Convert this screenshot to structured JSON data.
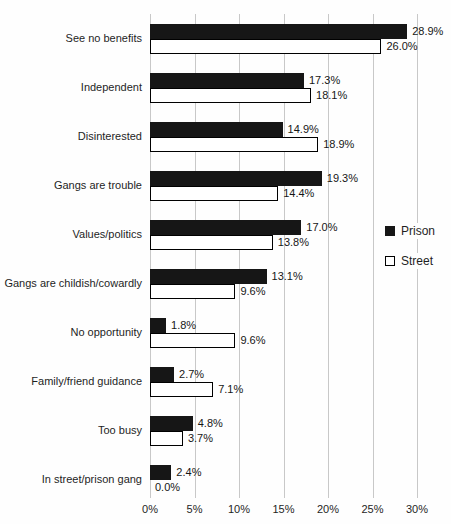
{
  "chart_data": {
    "type": "bar",
    "orientation": "horizontal",
    "title": "",
    "xlabel": "",
    "ylabel": "",
    "xlim": [
      0,
      30
    ],
    "grid": "vertical gridlines every 5%",
    "x_ticks": [
      "0%",
      "5%",
      "10%",
      "15%",
      "20%",
      "25%",
      "30%"
    ],
    "categories": [
      "See no benefits",
      "Independent",
      "Disinterested",
      "Gangs are trouble",
      "Values/politics",
      "Gangs are childish/cowardly",
      "No opportunity",
      "Family/friend guidance",
      "Too busy",
      "In street/prison gang"
    ],
    "series": [
      {
        "name": "Prison",
        "style": "filled",
        "color": "#161616",
        "values": [
          28.9,
          17.3,
          14.9,
          19.3,
          17.0,
          13.1,
          1.8,
          2.7,
          4.8,
          2.4
        ],
        "labels": [
          "28.9%",
          "17.3%",
          "14.9%",
          "19.3%",
          "17.0%",
          "13.1%",
          "1.8%",
          "2.7%",
          "4.8%",
          "2.4%"
        ]
      },
      {
        "name": "Street",
        "style": "outlined",
        "color": "#ffffff",
        "values": [
          26.0,
          18.1,
          18.9,
          14.4,
          13.8,
          9.6,
          9.6,
          7.1,
          3.7,
          0.0
        ],
        "labels": [
          "26.0%",
          "18.1%",
          "18.9%",
          "14.4%",
          "13.8%",
          "9.6%",
          "9.6%",
          "7.1%",
          "3.7%",
          "0.0%"
        ]
      }
    ],
    "legend": {
      "position": "mid-right",
      "entries": [
        {
          "label": "Prison",
          "swatch": "filled"
        },
        {
          "label": "Street",
          "swatch": "outlined"
        }
      ]
    },
    "colors": {
      "bar_fill": "#161616",
      "bar_outline": "#000000",
      "gridline": "#c8c8c8",
      "background": "#fefefe",
      "text": "#1f1f1f"
    }
  }
}
